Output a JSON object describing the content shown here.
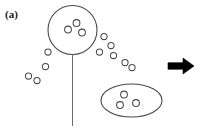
{
  "figure": {
    "panel_label": "(a)",
    "width": 198,
    "height": 135,
    "background_color": "#ffffff",
    "stroke_color": "#4a4a4a",
    "arrow_color": "#000000",
    "label_color": "#1a1a1a"
  },
  "chart_data": {
    "type": "scatter",
    "title": "(a)",
    "xlabel": "",
    "ylabel": "",
    "xlim": [
      0,
      198
    ],
    "ylim": [
      0,
      135
    ],
    "grid": false,
    "legend": "none",
    "elements": {
      "balloon_circle": {
        "name": "large-open-circle",
        "cx": 72.5,
        "cy": 30.0,
        "r": 24.5,
        "fill": "none",
        "stroke": "#4a4a4a",
        "stroke_width": 1.1
      },
      "stem_line": {
        "name": "vertical-stem",
        "x1": 72.5,
        "y1": 54.5,
        "x2": 72.5,
        "y2": 126.0,
        "stroke": "#6b6b6b",
        "stroke_width": 1.0
      },
      "ellipse": {
        "name": "oval-enclosure",
        "cx": 131.5,
        "cy": 100.5,
        "rx": 30.5,
        "ry": 16.5,
        "fill": "none",
        "stroke": "#4a4a4a",
        "stroke_width": 1.1
      },
      "arrow": {
        "name": "right-arrow",
        "x": 168,
        "y": 66,
        "length": 26,
        "direction": "right",
        "color": "#000000"
      }
    },
    "series": [
      {
        "name": "particles-inside-balloon",
        "marker": "open-circle",
        "radius": 3.4,
        "points": [
          {
            "x": 68.0,
            "y": 29.5
          },
          {
            "x": 76.5,
            "y": 23.0
          },
          {
            "x": 82.0,
            "y": 32.5
          }
        ]
      },
      {
        "name": "particles-inside-oval",
        "marker": "open-circle",
        "radius": 3.4,
        "points": [
          {
            "x": 124.0,
            "y": 94.5
          },
          {
            "x": 120.0,
            "y": 105.0
          },
          {
            "x": 136.0,
            "y": 103.0
          }
        ]
      },
      {
        "name": "particles-escaping-trail",
        "marker": "open-circle",
        "radius": 3.1,
        "points": [
          {
            "x": 104.0,
            "y": 36.5
          },
          {
            "x": 111.0,
            "y": 45.5
          },
          {
            "x": 99.5,
            "y": 52.0
          },
          {
            "x": 113.5,
            "y": 55.5
          },
          {
            "x": 125.0,
            "y": 62.5
          },
          {
            "x": 132.0,
            "y": 67.5
          }
        ]
      },
      {
        "name": "particles-scattered-left",
        "marker": "open-circle",
        "radius": 3.1,
        "points": [
          {
            "x": 45.5,
            "y": 66.5
          },
          {
            "x": 28.5,
            "y": 76.0
          },
          {
            "x": 37.0,
            "y": 80.5
          }
        ]
      },
      {
        "name": "particles-lower-left-of-balloon",
        "marker": "open-circle",
        "radius": 3.1,
        "points": [
          {
            "x": 48.0,
            "y": 52.0
          }
        ]
      }
    ]
  }
}
